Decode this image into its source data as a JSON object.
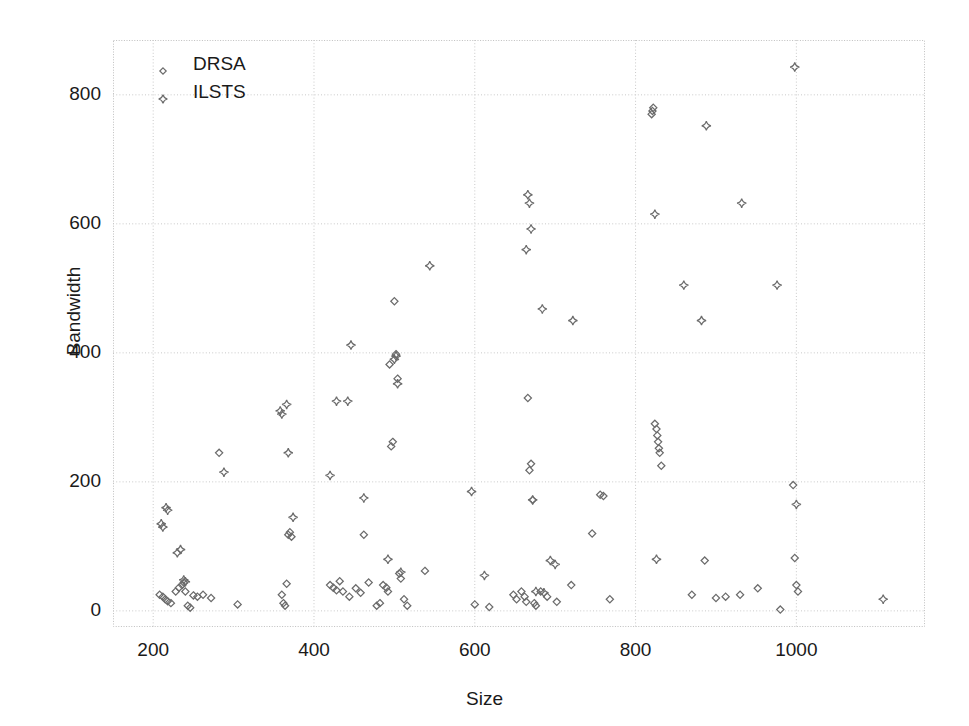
{
  "chart_data": {
    "type": "scatter",
    "title": "",
    "xlabel": "Size",
    "ylabel": "Bandwidth",
    "xlim": [
      150,
      1160
    ],
    "ylim": [
      -25,
      885
    ],
    "xticks": [
      200,
      400,
      600,
      800,
      1000
    ],
    "yticks": [
      0,
      200,
      400,
      600,
      800
    ],
    "grid": true,
    "legend_position": "top-left",
    "series": [
      {
        "name": "DRSA",
        "marker": "diamond",
        "color": "#6b6b6b",
        "points": [
          [
            208,
            25
          ],
          [
            212,
            22
          ],
          [
            215,
            18
          ],
          [
            218,
            15
          ],
          [
            222,
            12
          ],
          [
            228,
            30
          ],
          [
            232,
            36
          ],
          [
            236,
            40
          ],
          [
            238,
            44
          ],
          [
            240,
            30
          ],
          [
            243,
            8
          ],
          [
            246,
            5
          ],
          [
            250,
            24
          ],
          [
            255,
            22
          ],
          [
            262,
            25
          ],
          [
            272,
            20
          ],
          [
            282,
            245
          ],
          [
            305,
            10
          ],
          [
            360,
            25
          ],
          [
            362,
            12
          ],
          [
            364,
            8
          ],
          [
            366,
            42
          ],
          [
            368,
            118
          ],
          [
            370,
            122
          ],
          [
            372,
            115
          ],
          [
            420,
            40
          ],
          [
            424,
            36
          ],
          [
            428,
            32
          ],
          [
            432,
            46
          ],
          [
            436,
            30
          ],
          [
            444,
            22
          ],
          [
            452,
            35
          ],
          [
            458,
            28
          ],
          [
            462,
            118
          ],
          [
            468,
            44
          ],
          [
            478,
            8
          ],
          [
            482,
            12
          ],
          [
            486,
            40
          ],
          [
            490,
            36
          ],
          [
            492,
            30
          ],
          [
            494,
            382
          ],
          [
            496,
            255
          ],
          [
            498,
            262
          ],
          [
            500,
            480
          ],
          [
            502,
            398
          ],
          [
            504,
            360
          ],
          [
            506,
            58
          ],
          [
            508,
            50
          ],
          [
            512,
            18
          ],
          [
            516,
            8
          ],
          [
            538,
            62
          ],
          [
            600,
            10
          ],
          [
            618,
            6
          ],
          [
            648,
            25
          ],
          [
            652,
            18
          ],
          [
            658,
            30
          ],
          [
            662,
            22
          ],
          [
            664,
            14
          ],
          [
            666,
            330
          ],
          [
            668,
            218
          ],
          [
            670,
            228
          ],
          [
            672,
            172
          ],
          [
            674,
            12
          ],
          [
            676,
            8
          ],
          [
            682,
            30
          ],
          [
            690,
            22
          ],
          [
            702,
            14
          ],
          [
            720,
            40
          ],
          [
            746,
            120
          ],
          [
            756,
            180
          ],
          [
            760,
            178
          ],
          [
            768,
            18
          ],
          [
            820,
            770
          ],
          [
            821,
            775
          ],
          [
            822,
            780
          ],
          [
            824,
            290
          ],
          [
            826,
            282
          ],
          [
            827,
            272
          ],
          [
            828,
            262
          ],
          [
            829,
            252
          ],
          [
            830,
            245
          ],
          [
            832,
            225
          ],
          [
            870,
            25
          ],
          [
            886,
            78
          ],
          [
            900,
            20
          ],
          [
            912,
            22
          ],
          [
            930,
            25
          ],
          [
            952,
            35
          ],
          [
            980,
            2
          ],
          [
            996,
            195
          ],
          [
            998,
            82
          ],
          [
            1000,
            40
          ],
          [
            1002,
            30
          ]
        ]
      },
      {
        "name": "ILSTS",
        "marker": "cross",
        "color": "#6b6b6b",
        "points": [
          [
            210,
            135
          ],
          [
            212,
            130
          ],
          [
            216,
            160
          ],
          [
            218,
            156
          ],
          [
            230,
            90
          ],
          [
            234,
            95
          ],
          [
            238,
            48
          ],
          [
            240,
            45
          ],
          [
            288,
            215
          ],
          [
            358,
            310
          ],
          [
            360,
            305
          ],
          [
            366,
            320
          ],
          [
            368,
            245
          ],
          [
            374,
            145
          ],
          [
            420,
            210
          ],
          [
            428,
            325
          ],
          [
            442,
            325
          ],
          [
            446,
            412
          ],
          [
            462,
            175
          ],
          [
            492,
            80
          ],
          [
            500,
            390
          ],
          [
            502,
            395
          ],
          [
            504,
            352
          ],
          [
            508,
            60
          ],
          [
            544,
            535
          ],
          [
            596,
            185
          ],
          [
            612,
            55
          ],
          [
            664,
            560
          ],
          [
            666,
            645
          ],
          [
            668,
            632
          ],
          [
            670,
            592
          ],
          [
            672,
            172
          ],
          [
            676,
            30
          ],
          [
            684,
            468
          ],
          [
            686,
            28
          ],
          [
            694,
            78
          ],
          [
            700,
            72
          ],
          [
            722,
            450
          ],
          [
            824,
            615
          ],
          [
            826,
            80
          ],
          [
            860,
            505
          ],
          [
            882,
            450
          ],
          [
            888,
            752
          ],
          [
            932,
            632
          ],
          [
            976,
            505
          ],
          [
            998,
            843
          ],
          [
            1000,
            165
          ],
          [
            1108,
            18
          ]
        ]
      }
    ]
  },
  "legend": {
    "entries": [
      {
        "label": "DRSA",
        "marker": "diamond"
      },
      {
        "label": "ILSTS",
        "marker": "cross"
      }
    ]
  },
  "axis": {
    "x_title": "Size",
    "y_title": "Bandwidth",
    "x_tick_labels": [
      "200",
      "400",
      "600",
      "800",
      "1000"
    ],
    "y_tick_labels": [
      "0",
      "200",
      "400",
      "600",
      "800"
    ]
  },
  "colors": {
    "marker": "#6b6b6b",
    "grid": "#c9c9c9",
    "frame": "#bfbfbf",
    "text": "#1a1a1a"
  }
}
